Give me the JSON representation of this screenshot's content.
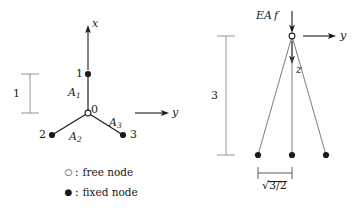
{
  "figure": {
    "type": "engineering-diagram",
    "stroke_color": "#1a1a1a",
    "dimension_color": "#8a8a8a",
    "background": "#ffffff"
  },
  "left_view": {
    "name": "plan-view",
    "axes": [
      {
        "id": "x",
        "label": "x",
        "direction": "up"
      },
      {
        "id": "y",
        "label": "y",
        "direction": "right"
      }
    ],
    "nodes": [
      {
        "id": "0",
        "label": "0",
        "kind": "free",
        "x": 88,
        "y": 113
      },
      {
        "id": "1",
        "label": "1",
        "kind": "fixed",
        "x": 88,
        "y": 74
      },
      {
        "id": "2",
        "label": "2",
        "kind": "fixed",
        "x": 52,
        "y": 135
      },
      {
        "id": "3",
        "label": "3",
        "kind": "fixed",
        "x": 123,
        "y": 135
      }
    ],
    "members": [
      {
        "id": "A1",
        "label": "A",
        "sub": "1",
        "from": "0",
        "to": "1"
      },
      {
        "id": "A2",
        "label": "A",
        "sub": "2",
        "from": "0",
        "to": "2"
      },
      {
        "id": "A3",
        "label": "A",
        "sub": "3",
        "from": "0",
        "to": "3"
      }
    ],
    "dimension": {
      "label": "1",
      "orientation": "vertical"
    }
  },
  "right_view": {
    "name": "elevation-view",
    "axes": [
      {
        "id": "y",
        "label": "y",
        "direction": "right"
      },
      {
        "id": "z",
        "label": "z",
        "direction": "down"
      }
    ],
    "load": {
      "label": "EA",
      "italic_suffix": "f",
      "direction": "down"
    },
    "nodes": [
      {
        "id": "0",
        "kind": "free",
        "x": 292,
        "y": 36
      },
      {
        "id": "2",
        "kind": "fixed",
        "x": 258,
        "y": 155
      },
      {
        "id": "1",
        "kind": "fixed",
        "x": 292,
        "y": 155
      },
      {
        "id": "3",
        "kind": "fixed",
        "x": 326,
        "y": 155
      }
    ],
    "dimension_height": {
      "label": "3",
      "orientation": "vertical"
    },
    "dimension_width": {
      "label": "3/2",
      "radical": "√",
      "orientation": "horizontal"
    }
  },
  "legend": {
    "name": "node-legend",
    "items": [
      {
        "marker": "open-circle",
        "glyph": "○",
        "separator": ":",
        "label": "free node"
      },
      {
        "marker": "filled-circle",
        "glyph": "●",
        "separator": ":",
        "label": "fixed node"
      }
    ]
  }
}
